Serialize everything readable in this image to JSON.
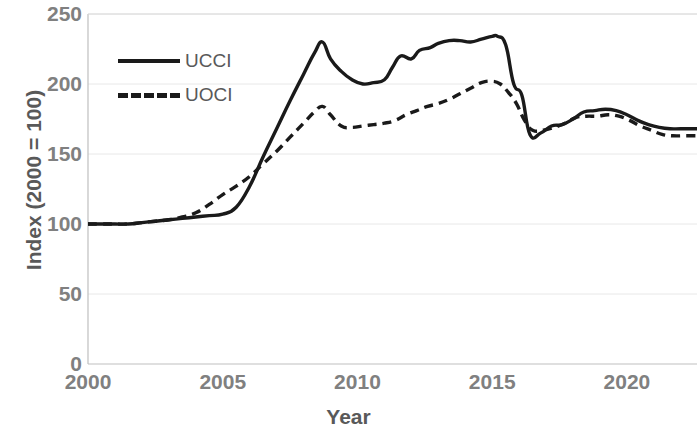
{
  "chart_data": {
    "type": "line",
    "title": "",
    "xlabel": "Year",
    "ylabel": "Index (2000 = 100)",
    "xlim": [
      2000,
      2022.6
    ],
    "ylim": [
      0,
      250
    ],
    "xticks": [
      2000,
      2005,
      2010,
      2015,
      2020
    ],
    "xtick_labels": [
      "2000",
      "2005",
      "2010",
      "2015",
      "2020"
    ],
    "yticks": [
      0,
      50,
      100,
      150,
      200,
      250
    ],
    "ytick_labels": [
      "0",
      "50",
      "100",
      "150",
      "200",
      "250"
    ],
    "grid": "horizontal",
    "legend_position": "upper-left",
    "line_color": "#1a1a1a",
    "axis_color": "#808080",
    "grid_color": "#e8e8e8",
    "series": [
      {
        "name": "UCCI",
        "style": "solid",
        "x": [
          2000.0,
          2000.5,
          2001.0,
          2001.5,
          2002.0,
          2002.5,
          2003.0,
          2003.5,
          2004.0,
          2004.5,
          2005.0,
          2005.5,
          2006.0,
          2006.5,
          2007.0,
          2007.5,
          2008.0,
          2008.4,
          2008.7,
          2009.0,
          2009.4,
          2009.8,
          2010.2,
          2010.6,
          2011.0,
          2011.3,
          2011.6,
          2012.0,
          2012.3,
          2012.7,
          2013.0,
          2013.4,
          2013.8,
          2014.2,
          2014.6,
          2015.0,
          2015.2,
          2015.5,
          2015.8,
          2016.1,
          2016.4,
          2016.8,
          2017.2,
          2017.6,
          2018.0,
          2018.4,
          2018.8,
          2019.2,
          2019.6,
          2020.0,
          2020.4,
          2020.8,
          2021.2,
          2021.6,
          2022.0,
          2022.6
        ],
        "y": [
          100,
          100,
          100,
          100,
          101,
          102,
          103,
          104,
          105,
          106,
          107,
          112,
          127,
          148,
          168,
          188,
          207,
          222,
          230,
          218,
          209,
          203,
          200,
          201,
          203,
          212,
          220,
          218,
          224,
          226,
          229,
          231,
          231,
          230,
          232,
          234,
          234,
          228,
          200,
          192,
          164,
          165,
          170,
          171,
          175,
          180,
          181,
          182,
          181,
          178,
          174,
          171,
          169,
          168,
          168,
          168
        ]
      },
      {
        "name": "UOCI",
        "style": "dashed",
        "x": [
          2000.0,
          2000.5,
          2001.0,
          2001.5,
          2002.0,
          2002.5,
          2003.0,
          2003.5,
          2004.0,
          2004.5,
          2005.0,
          2005.5,
          2006.0,
          2006.5,
          2007.0,
          2007.5,
          2008.0,
          2008.4,
          2008.7,
          2009.0,
          2009.4,
          2009.8,
          2010.2,
          2010.6,
          2011.0,
          2011.4,
          2011.8,
          2012.2,
          2012.6,
          2013.0,
          2013.4,
          2013.8,
          2014.2,
          2014.6,
          2015.0,
          2015.3,
          2015.6,
          2015.9,
          2016.2,
          2016.5,
          2016.9,
          2017.3,
          2017.7,
          2018.1,
          2018.5,
          2018.9,
          2019.3,
          2019.7,
          2020.1,
          2020.5,
          2020.9,
          2021.3,
          2021.7,
          2022.1,
          2022.6
        ],
        "y": [
          100,
          100,
          100,
          100,
          101,
          102,
          103,
          105,
          108,
          114,
          121,
          127,
          134,
          143,
          152,
          162,
          172,
          180,
          184,
          178,
          170,
          169,
          170,
          171,
          172,
          174,
          178,
          181,
          184,
          186,
          189,
          193,
          197,
          201,
          202,
          200,
          194,
          186,
          174,
          167,
          167,
          169,
          172,
          176,
          177,
          177,
          178,
          177,
          174,
          170,
          167,
          164,
          163,
          163,
          163
        ]
      }
    ]
  },
  "legend": {
    "items": [
      {
        "label": "UCCI",
        "style": "solid"
      },
      {
        "label": "UOCI",
        "style": "dashed"
      }
    ]
  }
}
